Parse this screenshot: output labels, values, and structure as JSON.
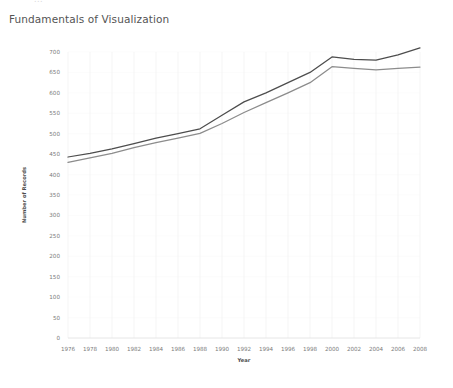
{
  "top_clip": {
    "text": "..."
  },
  "header": {
    "title": "Fundamentals of Visualization"
  },
  "axis_titles": {
    "x": "Year",
    "y": "Number of Records"
  },
  "colors": {
    "series_upper": "#4d4d4d",
    "series_lower": "#8c8c8c",
    "grid": "#f0f0f0",
    "tick_text": "#7b7b7b",
    "title_text": "#545454",
    "background": "#ffffff"
  },
  "chart_data": {
    "type": "line",
    "title": "Fundamentals of Visualization",
    "subtitle": "",
    "xlabel": "Year",
    "ylabel": "Number of Records",
    "xlim": [
      1976,
      2008
    ],
    "ylim": [
      0,
      700
    ],
    "grid": true,
    "legend": "none",
    "x": [
      1976,
      1978,
      1980,
      1982,
      1984,
      1986,
      1988,
      1990,
      1992,
      1994,
      1996,
      1998,
      2000,
      2002,
      2004,
      2006,
      2008
    ],
    "xtick_labels": [
      "1976",
      "1978",
      "1980",
      "1982",
      "1984",
      "1986",
      "1988",
      "1990",
      "1992",
      "1994",
      "1996",
      "1998",
      "2000",
      "2002",
      "2004",
      "2006",
      "2008"
    ],
    "ytick_labels": [
      "0",
      "50",
      "100",
      "150",
      "200",
      "250",
      "300",
      "350",
      "400",
      "450",
      "500",
      "550",
      "600",
      "650",
      "700"
    ],
    "ytick_values": [
      0,
      50,
      100,
      150,
      200,
      250,
      300,
      350,
      400,
      450,
      500,
      550,
      600,
      650,
      700
    ],
    "series": [
      {
        "name": "series-upper",
        "color": "#4d4d4d",
        "values": [
          443,
          452,
          463,
          476,
          489,
          500,
          512,
          545,
          578,
          600,
          625,
          650,
          688,
          682,
          680,
          693,
          710
        ]
      },
      {
        "name": "series-lower",
        "color": "#8c8c8c",
        "values": [
          430,
          441,
          452,
          466,
          478,
          489,
          501,
          525,
          552,
          576,
          600,
          625,
          664,
          660,
          656,
          660,
          663
        ]
      }
    ]
  }
}
